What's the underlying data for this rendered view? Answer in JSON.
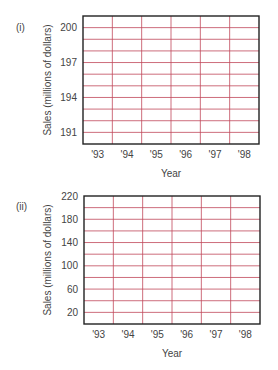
{
  "chart_data": [
    {
      "type": "table",
      "panel_label": "(i)",
      "title": "",
      "xlabel": "Year",
      "ylabel": "Sales (millions of dollars)",
      "categories": [
        "'93",
        "'94",
        "'95",
        "'96",
        "'97",
        "'98"
      ],
      "ylim": [
        190,
        201
      ],
      "yticks": [
        191,
        194,
        197,
        200
      ],
      "ytick_labels": [
        "191",
        "194",
        "197",
        "200"
      ],
      "y_gridlines": [
        191,
        192,
        193,
        194,
        195,
        196,
        197,
        198,
        199,
        200
      ],
      "grid": true,
      "series": []
    },
    {
      "type": "table",
      "panel_label": "(ii)",
      "title": "",
      "xlabel": "Year",
      "ylabel": "Sales (millions of dollars)",
      "categories": [
        "'93",
        "'94",
        "'95",
        "'96",
        "'97",
        "'98"
      ],
      "ylim": [
        0,
        220
      ],
      "yticks": [
        20,
        60,
        100,
        140,
        180,
        220
      ],
      "ytick_labels": [
        "20",
        "60",
        "100",
        "140",
        "180",
        "220"
      ],
      "y_gridlines": [
        20,
        40,
        60,
        80,
        100,
        120,
        140,
        160,
        180,
        200
      ],
      "grid": true,
      "series": []
    }
  ],
  "colors": {
    "grid": "#c0485a",
    "frame": "#222222",
    "text": "#444444"
  }
}
